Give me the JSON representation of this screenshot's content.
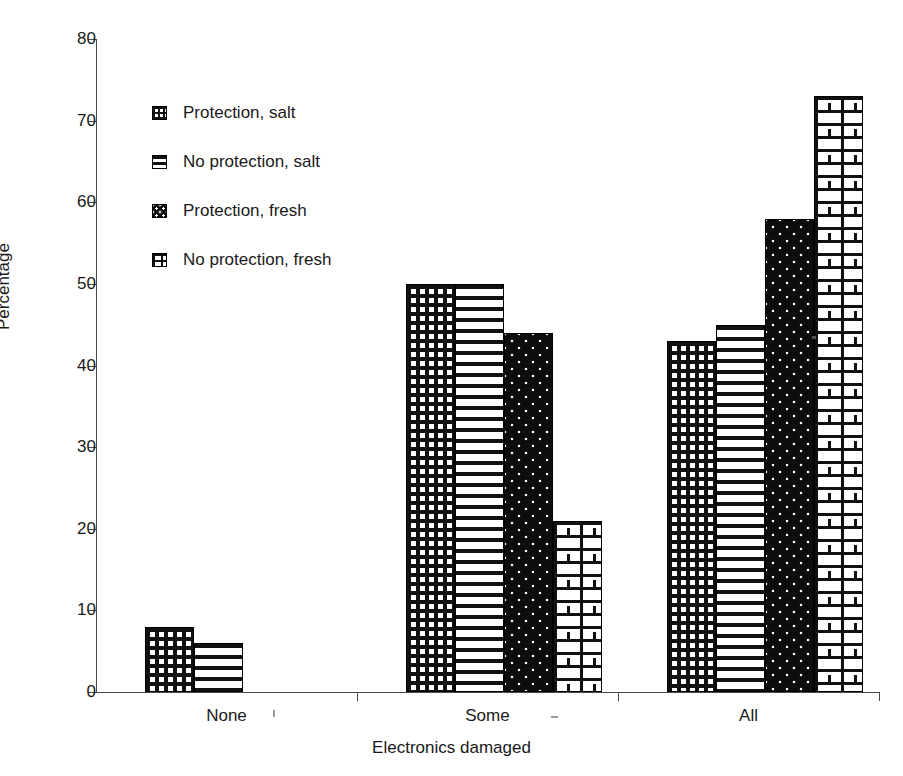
{
  "chart_data": {
    "type": "bar",
    "title": "",
    "subtitle": "",
    "xlabel": "Electronics damaged",
    "ylabel": "Percentage",
    "categories": [
      "None",
      "Some",
      "All"
    ],
    "series": [
      {
        "name": "Protection, salt",
        "pattern": "grid",
        "values": [
          8,
          50,
          43
        ]
      },
      {
        "name": "No protection, salt",
        "pattern": "hstripe",
        "values": [
          6,
          50,
          45
        ]
      },
      {
        "name": "Protection, fresh",
        "pattern": "dots",
        "values": [
          0,
          44,
          58
        ]
      },
      {
        "name": "No protection, fresh",
        "pattern": "brick",
        "values": [
          0,
          21,
          73
        ]
      }
    ],
    "ylim": [
      0,
      80
    ],
    "ytick_step": 10,
    "yticks": [
      "80",
      "70",
      "60",
      "50",
      "40",
      "30",
      "20",
      "10",
      "0"
    ],
    "grid": false,
    "legend_position": "upper-left-inside",
    "colors": {
      "ink": "#111111",
      "axis": "#4a4a4a",
      "background": "#ffffff"
    }
  },
  "legend": {
    "items": [
      {
        "label": "Protection, salt"
      },
      {
        "label": "No protection, salt"
      },
      {
        "label": "Protection, fresh"
      },
      {
        "label": "No protection, fresh"
      }
    ]
  }
}
